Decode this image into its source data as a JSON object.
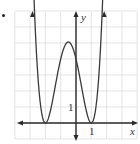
{
  "chart_data": {
    "type": "line",
    "title": "",
    "function": "y = (x + 2)^2 (x - 1)^2",
    "xlabel": "x",
    "ylabel": "y",
    "tick_labels": {
      "x": [
        "1"
      ],
      "y": [
        "1"
      ]
    },
    "xlim": [
      -5,
      4
    ],
    "ylim": [
      -1,
      7
    ],
    "grid": true,
    "x": [
      -2.9,
      -2.5,
      -2,
      -1.5,
      -1,
      -0.5,
      0,
      0.5,
      1,
      1.5,
      1.9
    ],
    "values": [
      6.6,
      2.81,
      0,
      1.56,
      4,
      5.06,
      4,
      1.56,
      0,
      2.81,
      6.6
    ],
    "key_points": {
      "roots": [
        -2,
        1
      ],
      "local_max": [
        -0.5,
        5.06
      ],
      "y_intercept": 4
    }
  },
  "labels": {
    "x_axis": "x",
    "y_axis": "y",
    "x_tick": "1",
    "y_tick": "1"
  },
  "colors": {
    "grid": "#dcdcdc",
    "axis": "#2a2a2a",
    "curve": "#3a3a3a"
  }
}
